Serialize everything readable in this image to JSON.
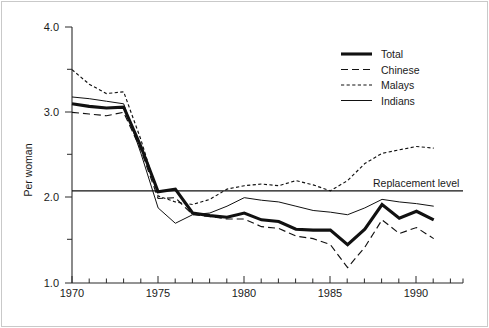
{
  "chart_data": {
    "type": "line",
    "title": "",
    "xlabel": "",
    "ylabel": "Per woman",
    "xlim": [
      1970,
      1992.7
    ],
    "ylim": [
      1.0,
      4.0
    ],
    "grid": false,
    "legend_position": "top-right",
    "x": [
      1970,
      1971,
      1972,
      1973,
      1974,
      1975,
      1976,
      1977,
      1978,
      1979,
      1980,
      1981,
      1982,
      1983,
      1984,
      1985,
      1986,
      1987,
      1988,
      1989,
      1990,
      1991
    ],
    "xticks_major": [
      1970,
      1975,
      1980,
      1985,
      1990
    ],
    "xtick_labels": [
      "1970",
      "1975",
      "1980",
      "1985",
      "1990"
    ],
    "yticks_major": [
      1.0,
      2.0,
      3.0,
      4.0
    ],
    "ytick_labels": [
      "1.0",
      "2.0",
      "3.0",
      "4.0"
    ],
    "yticks_minor": [
      1.5,
      2.5,
      3.5
    ],
    "series": [
      {
        "name": "Total",
        "style": "thick-solid",
        "values": [
          3.1,
          3.07,
          3.05,
          3.06,
          2.6,
          2.07,
          2.1,
          1.82,
          1.79,
          1.77,
          1.82,
          1.74,
          1.72,
          1.63,
          1.62,
          1.62,
          1.45,
          1.63,
          1.92,
          1.76,
          1.84,
          1.74
        ]
      },
      {
        "name": "Chinese",
        "style": "long-dash",
        "values": [
          3.0,
          2.98,
          2.96,
          3.0,
          2.56,
          1.99,
          2.0,
          1.8,
          1.78,
          1.75,
          1.75,
          1.66,
          1.64,
          1.55,
          1.52,
          1.45,
          1.18,
          1.42,
          1.74,
          1.58,
          1.65,
          1.52
        ]
      },
      {
        "name": "Malays",
        "style": "short-dash",
        "values": [
          3.5,
          3.33,
          3.22,
          3.24,
          2.68,
          2.02,
          1.95,
          1.92,
          1.98,
          2.1,
          2.14,
          2.16,
          2.14,
          2.2,
          2.15,
          2.08,
          2.2,
          2.4,
          2.52,
          2.56,
          2.6,
          2.58
        ]
      },
      {
        "name": "Indians",
        "style": "thin-solid",
        "values": [
          3.18,
          3.16,
          3.13,
          3.1,
          2.52,
          1.88,
          1.7,
          1.8,
          1.82,
          1.9,
          2.0,
          1.97,
          1.95,
          1.9,
          1.85,
          1.83,
          1.8,
          1.88,
          1.98,
          1.95,
          1.93,
          1.9
        ]
      }
    ],
    "annotations": [
      {
        "name": "replacement-level",
        "label": "Replacement level",
        "value": 2.08,
        "type": "hline"
      }
    ]
  },
  "legend": {
    "items": [
      {
        "label": "Total"
      },
      {
        "label": "Chinese"
      },
      {
        "label": "Malays"
      },
      {
        "label": "Indians"
      }
    ]
  }
}
